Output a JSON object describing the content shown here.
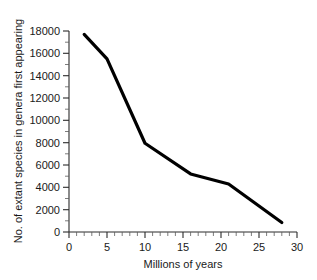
{
  "chart_data": {
    "type": "line",
    "title": "",
    "subtitle": "",
    "xlabel": "Millions of years",
    "ylabel": "No. of extant species in genera first appearing",
    "xlim": [
      0,
      30
    ],
    "ylim": [
      0,
      18000
    ],
    "x_ticks": [
      0,
      5,
      10,
      15,
      20,
      25,
      30
    ],
    "x_tick_labels": [
      "0",
      "5",
      "10",
      "15",
      "20",
      "25",
      "30"
    ],
    "y_ticks": [
      0,
      2000,
      4000,
      6000,
      8000,
      10000,
      12000,
      14000,
      16000,
      18000
    ],
    "y_tick_labels": [
      "0",
      "2000",
      "4000",
      "6000",
      "8000",
      "10000",
      "12000",
      "14000",
      "16000",
      "18000"
    ],
    "x_minor_tick_step": 1,
    "y_minor_tick_step": 1000,
    "grid": false,
    "legend": false,
    "legend_position": "none",
    "series": [
      {
        "name": "Extant species in genera first appearing",
        "color": "#000000",
        "x": [
          2,
          5,
          10,
          16,
          21,
          28
        ],
        "values": [
          17700,
          15500,
          7950,
          5200,
          4300,
          850
        ]
      }
    ],
    "annotations": []
  }
}
